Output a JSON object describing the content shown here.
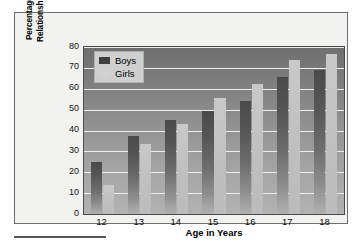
{
  "chart_data": {
    "type": "bar",
    "title": "",
    "xlabel": "Age in Years",
    "ylabel": "Percentage Reporting a Romantic Relationship in the Past 18 Months",
    "categories": [
      "12",
      "13",
      "14",
      "15",
      "16",
      "17",
      "18"
    ],
    "series": [
      {
        "name": "Boys",
        "color": "#4a4a4a",
        "values": [
          25,
          37.5,
          45,
          49.5,
          54,
          65.5,
          69
        ]
      },
      {
        "name": "Girls",
        "color": "#c6c6c6",
        "values": [
          14,
          33.5,
          43,
          55.5,
          62.5,
          74,
          76.5
        ]
      }
    ],
    "ylim": [
      0,
      80
    ],
    "yticks": [
      0,
      10,
      20,
      30,
      40,
      50,
      60,
      70,
      80
    ],
    "ytick_labels": [
      "0",
      "10",
      "20",
      "30",
      "40",
      "50",
      "60",
      "70",
      "80"
    ],
    "grid": true,
    "legend_position": "top-left"
  },
  "legend": {
    "items": [
      {
        "label": "Boys"
      },
      {
        "label": "Girls"
      }
    ]
  },
  "axes": {
    "y_title": "Percentage Reporting a Romantic Relationship in the Past 18 Months",
    "x_title": "Age in Years"
  }
}
